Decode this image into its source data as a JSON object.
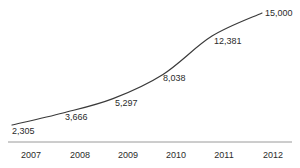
{
  "chart_data": {
    "type": "line",
    "title": "",
    "subtitle": "",
    "xlabel": "",
    "ylabel": "",
    "categories": [
      "2007",
      "2008",
      "2009",
      "2010",
      "2011",
      "2012"
    ],
    "values": [
      2305,
      3666,
      5297,
      8038,
      12381,
      15000
    ],
    "data_labels": [
      "2,305",
      "3,666",
      "5,297",
      "8,038",
      "12,381",
      "15,000"
    ],
    "series": [
      {
        "name": "",
        "values": [
          2305,
          3666,
          5297,
          8038,
          12381,
          15000
        ]
      }
    ],
    "ylim": [
      0,
      15000
    ],
    "grid": false,
    "legend": false,
    "legend_position": "none",
    "y_axis_visible": false,
    "x_axis_visible": true,
    "markers": false,
    "line_color": "#3a3a3a",
    "axis_color": "#9a9a9a",
    "text_color": "#2b2b2b",
    "background_color": "#ffffff"
  },
  "axis": {
    "ticks": [
      {
        "label": "2007"
      },
      {
        "label": "2008"
      },
      {
        "label": "2009"
      },
      {
        "label": "2010"
      },
      {
        "label": "2011"
      },
      {
        "label": "2012"
      }
    ]
  },
  "labels": {
    "p0": "2,305",
    "p1": "3,666",
    "p2": "5,297",
    "p3": "8,038",
    "p4": "12,381",
    "p5": "15,000"
  }
}
